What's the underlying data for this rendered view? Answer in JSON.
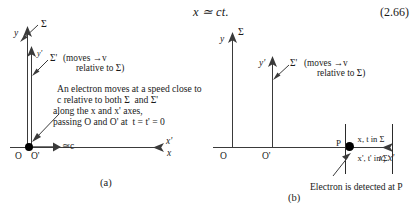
{
  "equation": {
    "expression": "x ≃ ct.",
    "number": "(2.66)"
  },
  "panel_a": {
    "caption": "(a)",
    "frame_sigma_label": "Σ",
    "frame_sigma_prime_label": "Σ'",
    "y_axis_label": "y",
    "y_prime_axis_label": "y'",
    "x_axis_label": "x",
    "x_prime_axis_label": "x'",
    "origin_label": "O",
    "origin_prime_label": "O'",
    "speed_label": "≃c",
    "moves_note_line1": "(moves →v",
    "moves_note_line2": "relative to Σ)",
    "description_line1": "An electron moves at a speed close to",
    "description_line2": "c relative to both Σ  and Σ'",
    "description_line3": "along the x and x' axes,",
    "description_line4": "passing O and O' at  t = t' = 0"
  },
  "panel_b": {
    "caption": "(b)",
    "frame_sigma_label": "Σ",
    "frame_sigma_prime_label": "Σ'",
    "y_axis_label": "y",
    "y_prime_axis_label": "y'",
    "x_axis_label": "x, x'",
    "origin_label": "O",
    "origin_prime_label": "O'",
    "event_point_label": "P",
    "moves_note_line1": "(moves →v",
    "moves_note_line2": "relative to Σ)",
    "coords_line1": "x, t in Σ",
    "coords_line2": "x', t' in Σ'",
    "detection_note": "Electron is detected at P"
  },
  "colors": {
    "ink": "#1a1a1a",
    "axis": "#3a3a3a",
    "marker": "#000000"
  }
}
